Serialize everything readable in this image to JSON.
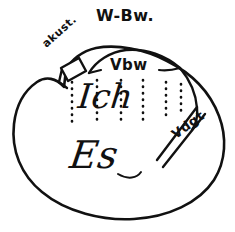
{
  "figure": {
    "name": "freud-structural-model-diagram",
    "title_label": "W-Bw.",
    "ink_color": "#111111",
    "background_color": "#ffffff",
    "width": 235,
    "height": 232
  },
  "labels": {
    "top": "W-Bw.",
    "acoustic": "akust.",
    "preconscious": "Vbw",
    "ego": "Ich",
    "id": "Es",
    "repressed": "Vdgt"
  },
  "regions": [
    {
      "id": "w-bw",
      "label": "W-Bw.",
      "position": "top-outside"
    },
    {
      "id": "akust",
      "label": "akust.",
      "position": "upper-left-cap"
    },
    {
      "id": "vbw",
      "label": "Vbw",
      "position": "upper-inner-arc"
    },
    {
      "id": "ich",
      "label": "Ich",
      "position": "center"
    },
    {
      "id": "vdgt",
      "label": "Vdgt",
      "position": "right-diagonal-band"
    },
    {
      "id": "es",
      "label": "Es",
      "position": "lower-center"
    }
  ],
  "dotted_columns": {
    "count": 6,
    "x_positions": [
      72,
      97,
      121,
      143,
      166,
      181
    ],
    "dot_color": "#111111"
  }
}
